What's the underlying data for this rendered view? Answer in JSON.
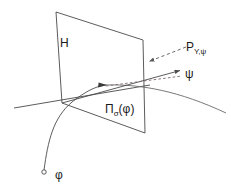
{
  "figure": {
    "domain": "Diagram",
    "width": 231,
    "height": 190,
    "background_color": "#ffffff",
    "stroke_color": "#4a4a4a",
    "text_color": "#1a1a1a"
  },
  "labels": {
    "hyperplane": {
      "name": "H",
      "base": "H",
      "sub": "",
      "tail": ""
    },
    "projector": {
      "name": "P_{Y,psi}",
      "base": "P",
      "sub": "Y,ψ",
      "tail": ""
    },
    "tangent_vector": {
      "name": "psi",
      "base": "ψ",
      "sub": "",
      "tail": ""
    },
    "projection": {
      "name": "Pi_sigma(phi)",
      "base": "Π",
      "sub": "σ",
      "tail": "(φ)"
    },
    "curve": {
      "name": "phi",
      "base": "φ",
      "sub": "",
      "tail": ""
    }
  },
  "geometry": {
    "plane_H": {
      "name": "hyperplane-quadrilateral",
      "points": "56,12 143,40 145,133 62,103",
      "fill": "#ffffff",
      "stroke": "#4a4a4a"
    },
    "axis_line": {
      "name": "base-axis-line",
      "from": [
        14,
        108
      ],
      "to": [
        150,
        85
      ]
    },
    "psi_arrow": {
      "name": "psi-tangent-arrow",
      "from": [
        62,
        103
      ],
      "to": [
        182,
        70
      ]
    },
    "psi_dashed": {
      "name": "psi-projection-dashed",
      "from": [
        105,
        86
      ],
      "to": [
        183,
        76
      ]
    },
    "dashed_pointer": {
      "name": "P-dashed-pointer",
      "from": [
        186,
        47
      ],
      "to": [
        147,
        62
      ]
    },
    "phi_curve": {
      "name": "phi-curve",
      "path": "M 44,170 C 48,140 52,118 72,102 C 92,88 100,86 107,85"
    },
    "right_curve": {
      "name": "right-sweep-curve",
      "path": "M 107,85 C 140,84 178,90 226,113"
    },
    "phi_endpoint": {
      "name": "phi-endpoint-circle",
      "center": [
        44,
        172
      ],
      "r": 2.2
    },
    "tangent_marker": {
      "name": "tangent-point-arrowhead",
      "at": [
        106,
        85
      ]
    }
  }
}
